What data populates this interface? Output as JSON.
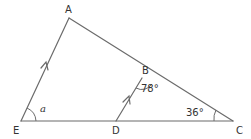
{
  "diagram": {
    "type": "geometry-triangle",
    "colors": {
      "line": "#6b6b6b",
      "text": "#333333",
      "background": "#ffffff"
    },
    "vertices": {
      "A": {
        "label": "A",
        "x": 69,
        "y": 18
      },
      "B": {
        "label": "B",
        "x": 142,
        "y": 78
      },
      "C": {
        "label": "C",
        "x": 233,
        "y": 121
      },
      "D": {
        "label": "D",
        "x": 116,
        "y": 121
      },
      "E": {
        "label": "E",
        "x": 21,
        "y": 121
      }
    },
    "segments": [
      "AE",
      "AC",
      "EC",
      "DB"
    ],
    "parallel_marks": [
      "AE",
      "DB"
    ],
    "angles": {
      "E": {
        "label": "a"
      },
      "B": {
        "label": "78°"
      },
      "C": {
        "label": "36°"
      }
    }
  }
}
